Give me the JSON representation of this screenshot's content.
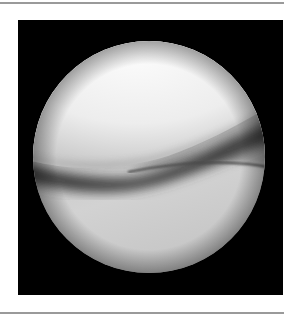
{
  "figure": {
    "type": "arthroscopic-view",
    "colors": {
      "background": "#ffffff",
      "rule": "#9a9a9a",
      "frame": "#000000",
      "upper_surface": "#f4f4f4",
      "shadow_band": "#3a3a3a",
      "lower_surface": "#c8c8c8"
    }
  }
}
